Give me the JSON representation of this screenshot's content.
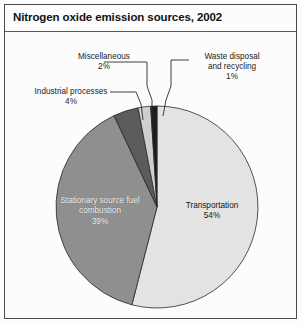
{
  "figure": {
    "title": "Nitrogen oxide emission sources, 2002",
    "border_color": "#4a4a4a",
    "background": "#fcfcfc"
  },
  "chart_data": {
    "type": "pie",
    "title": "Nitrogen oxide emission sources, 2002",
    "xlabel": "",
    "ylabel": "",
    "unit": "%",
    "legend": "none",
    "grid": false,
    "start_angle_deg": 0,
    "direction": "clockwise",
    "categories": [
      "Transportation",
      "Stationary source fuel combustion",
      "Industrial processes",
      "Miscellaneous",
      "Waste disposal and recycling"
    ],
    "values": [
      54,
      39,
      4,
      2,
      1
    ],
    "colors": [
      "#e3e3e3",
      "#8f8f8f",
      "#5b5b5b",
      "#cfcfcf",
      "#1d1d1d"
    ],
    "slices": [
      {
        "name": "Transportation",
        "value": 54,
        "value_label": "54%",
        "color": "#e3e3e3",
        "label_placement": "inside",
        "label_color": "#161616"
      },
      {
        "name": "Stationary source fuel combustion",
        "value": 39,
        "value_label": "39%",
        "color": "#8f8f8f",
        "label_placement": "inside",
        "label_color": "#f2f2f2"
      },
      {
        "name": "Industrial processes",
        "value": 4,
        "value_label": "4%",
        "color": "#5b5b5b",
        "label_placement": "callout",
        "label_color": "#1b1b1b"
      },
      {
        "name": "Miscellaneous",
        "value": 2,
        "value_label": "2%",
        "color": "#cfcfcf",
        "label_placement": "callout",
        "label_color": "#1b1b1b"
      },
      {
        "name": "Waste disposal and recycling",
        "value": 1,
        "value_label": "1%",
        "color": "#1d1d1d",
        "label_placement": "callout",
        "label_color": "#1b1b1b"
      }
    ]
  },
  "callouts": {
    "miscellaneous": {
      "line1": "Miscellaneous",
      "line2": "2%"
    },
    "industrial": {
      "line1": "Industrial processes",
      "line2": "4%"
    },
    "waste": {
      "line1": "Waste disposal",
      "line2": "and recycling",
      "line3": "1%"
    }
  },
  "inside_labels": {
    "stationary": {
      "line1": "Stationary source fuel",
      "line2": "combustion",
      "line3": "39%"
    },
    "transportation": {
      "line1": "Transportation",
      "line2": "54%"
    }
  }
}
